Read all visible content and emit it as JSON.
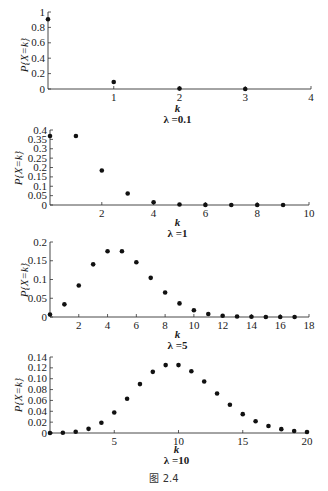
{
  "figure": {
    "caption": "图 2.4"
  },
  "chart_data": [
    {
      "type": "scatter",
      "title": "λ =0.1",
      "xlabel": "k",
      "ylabel": "P{X=k}",
      "xlim": [
        0,
        4
      ],
      "ylim": [
        0,
        1
      ],
      "xticks": [
        1,
        2,
        3,
        4
      ],
      "yticks": [
        0,
        0.2,
        0.4,
        0.6,
        0.8,
        1
      ],
      "ytick_labels": [
        "0",
        "0.2",
        "0.4",
        "0.6",
        "0.8",
        "1"
      ],
      "x": [
        0,
        1,
        2,
        3
      ],
      "values": [
        0.905,
        0.09,
        0.005,
        0.0002
      ],
      "grid": false
    },
    {
      "type": "scatter",
      "title": "λ =1",
      "xlabel": "k",
      "ylabel": "P{X=k}",
      "xlim": [
        0,
        10
      ],
      "ylim": [
        0,
        0.4
      ],
      "xticks": [
        2,
        4,
        6,
        8,
        10
      ],
      "yticks": [
        0,
        0.05,
        0.1,
        0.15,
        0.2,
        0.25,
        0.3,
        0.35,
        0.4
      ],
      "ytick_labels": [
        "0",
        "0.05",
        "0.1",
        "0.15",
        "0.2",
        "0.25",
        "0.3",
        "0.35",
        "0.4"
      ],
      "x": [
        0,
        1,
        2,
        3,
        4,
        5,
        6,
        7,
        8,
        9
      ],
      "values": [
        0.368,
        0.368,
        0.184,
        0.061,
        0.015,
        0.003,
        0.0005,
        0.0001,
        0.0,
        0.0
      ],
      "grid": false
    },
    {
      "type": "scatter",
      "title": "λ =5",
      "xlabel": "k",
      "ylabel": "P{X=k}",
      "xlim": [
        0,
        18
      ],
      "ylim": [
        0,
        0.2
      ],
      "xticks": [
        2,
        4,
        6,
        8,
        10,
        12,
        14,
        16,
        18
      ],
      "yticks": [
        0,
        0.05,
        0.1,
        0.15,
        0.2
      ],
      "ytick_labels": [
        "0",
        "0.05",
        "0.1",
        "0.15",
        "0.2"
      ],
      "x": [
        0,
        1,
        2,
        3,
        4,
        5,
        6,
        7,
        8,
        9,
        10,
        11,
        12,
        13,
        14,
        15,
        16,
        17
      ],
      "values": [
        0.0067,
        0.0337,
        0.0842,
        0.1404,
        0.1755,
        0.1755,
        0.1462,
        0.1044,
        0.0653,
        0.0363,
        0.0181,
        0.0082,
        0.0034,
        0.0013,
        0.0005,
        0.0002,
        0.0001,
        0.0
      ],
      "grid": false
    },
    {
      "type": "scatter",
      "title": "λ =10",
      "xlabel": "k",
      "ylabel": "P{X=k}",
      "xlim": [
        0,
        20
      ],
      "ylim": [
        0,
        0.14
      ],
      "xticks": [
        5,
        10,
        15,
        20
      ],
      "yticks": [
        0,
        0.02,
        0.04,
        0.06,
        0.08,
        0.1,
        0.12,
        0.14
      ],
      "ytick_labels": [
        "0",
        "0.02",
        "0.04",
        "0.06",
        "0.08",
        "0.10",
        "0.12",
        "0.14"
      ],
      "x": [
        0,
        1,
        2,
        3,
        4,
        5,
        6,
        7,
        8,
        9,
        10,
        11,
        12,
        13,
        14,
        15,
        16,
        17,
        18,
        19,
        20
      ],
      "values": [
        0.0,
        0.0005,
        0.0023,
        0.0076,
        0.0189,
        0.0378,
        0.0631,
        0.0901,
        0.1126,
        0.1251,
        0.1251,
        0.1137,
        0.0948,
        0.0729,
        0.0521,
        0.0347,
        0.0217,
        0.0128,
        0.0071,
        0.0037,
        0.0019
      ],
      "grid": false
    }
  ],
  "layout": [
    {
      "x0": 48,
      "x1": 311,
      "yTop": 12,
      "yBot": 89,
      "ylabel_x": 28,
      "ylabel_y": 55,
      "klab_y": 112,
      "lam_y": 123
    },
    {
      "x0": 50,
      "x1": 309,
      "yTop": 130,
      "yBot": 205,
      "ylabel_x": 22,
      "ylabel_y": 168,
      "klab_y": 226,
      "lam_y": 237
    },
    {
      "x0": 50,
      "x1": 309,
      "yTop": 242,
      "yBot": 317,
      "ylabel_x": 28,
      "ylabel_y": 280,
      "klab_y": 338,
      "lam_y": 349
    },
    {
      "x0": 50,
      "x1": 307,
      "yTop": 357,
      "yBot": 433,
      "ylabel_x": 22,
      "ylabel_y": 395,
      "klab_y": 453,
      "lam_y": 464
    }
  ]
}
